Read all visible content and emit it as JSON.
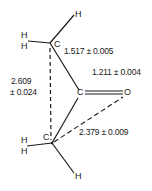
{
  "molecule": {
    "atoms": {
      "c_upper": "C",
      "c_carbonyl": "C",
      "c_lower": "C",
      "o": "O",
      "h_top": "H",
      "h_upper_1": "H",
      "h_upper_2": "H",
      "h_lower_1": "H",
      "h_lower_2": "H",
      "h_bottom": "H"
    },
    "distances": {
      "cc_bond": "1.517 ± 0.005",
      "co_bond": "1.211 ± 0.004",
      "cc_nonbonded_value": "2.609",
      "cc_nonbonded_error": "± 0.024",
      "co_nonbonded": "2.379 ± 0.009"
    },
    "colors": {
      "line": "#1a1a1a",
      "background": "#ffffff"
    }
  }
}
